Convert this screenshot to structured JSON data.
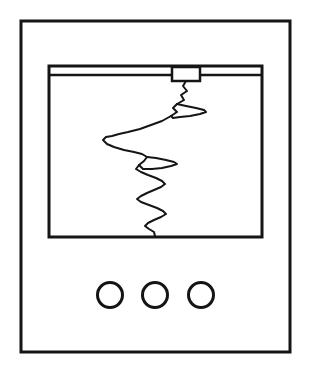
{
  "figure": {
    "background_color": "#ffffff",
    "ink_color": "#151515",
    "canvas": {
      "width": 313,
      "height": 387
    }
  },
  "outer_case": {
    "name": "Instrument case outline",
    "x": 21,
    "y": 21,
    "width": 269,
    "height": 331,
    "stroke_width": 3,
    "fill": "#ffffff"
  },
  "screen": {
    "name": "Recording paper window",
    "x": 49,
    "y": 66,
    "width": 213,
    "height": 171,
    "stroke_width": 3,
    "fill": "#ffffff"
  },
  "rail": {
    "name": "Pen carriage rail",
    "x1": 51,
    "y1": 75,
    "x2": 260,
    "y2": 75,
    "stroke_width": 2.5
  },
  "carriage": {
    "name": "Pen carriage block",
    "x": 172,
    "y": 67,
    "width": 28,
    "height": 14,
    "stroke_width": 2.5,
    "fill": "#ffffff"
  },
  "trace": {
    "name": "Seismic trace",
    "stroke_width": 2,
    "orientation": "vertical",
    "start": {
      "x": 186,
      "y": 81
    },
    "end": {
      "x": 155,
      "y": 236
    },
    "points": "186,81 183,86 187,91 181,95 184,100 177,104 173,108 177,112 171,116 162,121 151,125 140,129 128,132 119,134 112,136 106,137 103,140 107,144 114,147 124,150 134,152 142,154 147,157 144,161 139,165 136,169 141,172 148,175 156,178 162,181 165,184 161,187 154,190 147,193 141,196 137,199 141,202 149,205 157,208 163,211 166,214 161,217 154,220 148,223 145,226 149,229 154,232 155,236",
    "upper_lobe_extreme_x": 206,
    "left_lobe_extreme_x": 103
  },
  "knobs": {
    "name": "Control knobs row",
    "count": 3,
    "radius": 12.5,
    "stroke_width": 3,
    "fill": "#ffffff",
    "center_y": 295,
    "items": [
      {
        "label": "knob-1",
        "cx": 110,
        "cy": 295
      },
      {
        "label": "knob-2",
        "cx": 155,
        "cy": 295
      },
      {
        "label": "knob-3",
        "cx": 201,
        "cy": 295
      }
    ]
  },
  "accessibility": {
    "figure_description": "Black line drawing of a seismograph: a rectangular case containing a paper window with a horizontal rail and pen carriage at the top, a jagged vertical seismic trace across the paper, and three round control knobs below the window."
  }
}
